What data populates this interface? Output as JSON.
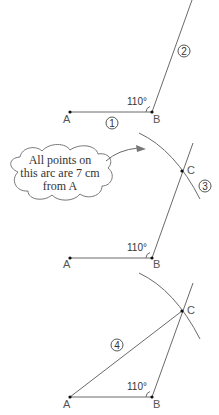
{
  "diagram": {
    "steps": [
      {
        "step": "1",
        "points": {
          "A": "A",
          "B": "B"
        },
        "angle_label": "110°",
        "step2_label": "2"
      },
      {
        "step": "3",
        "points": {
          "A": "A",
          "B": "B",
          "C": "C"
        },
        "angle_label": "110°",
        "callout": {
          "line1": "All points on",
          "line2": "this arc are 7 cm",
          "line3": "from A"
        }
      },
      {
        "step": "4",
        "points": {
          "A": "A",
          "B": "B",
          "C": "C"
        },
        "angle_label": "110°"
      }
    ]
  }
}
